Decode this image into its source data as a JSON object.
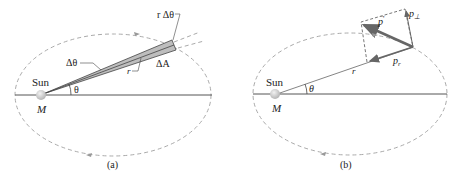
{
  "panels": [
    {
      "id": "a",
      "caption": "(a)",
      "sun_label": "Sun",
      "mass_label": "M",
      "angle_label": "θ",
      "delta_theta_label": "Δθ",
      "radius_label": "r",
      "arc_label": "r Δθ",
      "area_label": "ΔA"
    },
    {
      "id": "b",
      "caption": "(b)",
      "sun_label": "Sun",
      "mass_label": "M",
      "angle_label": "θ",
      "radius_label": "r",
      "momentum_label": "p",
      "radial_component_label": "p",
      "radial_subscript": "r",
      "perp_component_label": "p",
      "perp_subscript": "⊥"
    }
  ],
  "colors": {
    "orbit": "#aaaaaa",
    "axis": "#555555",
    "wedge_fill": "#bdbdbd",
    "vector": "#666666",
    "sun": "#d0d0d0"
  }
}
